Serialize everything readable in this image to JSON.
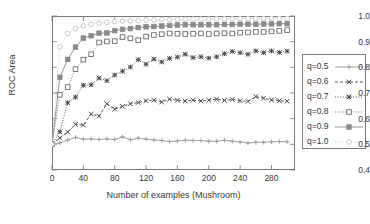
{
  "chart_data": {
    "type": "line",
    "title": "",
    "subtitle": "",
    "xlabel": "Number of examples (Mushroom)",
    "ylabel": "ROC Area",
    "xlim": [
      0,
      310
    ],
    "ylim": [
      0.4,
      1.0
    ],
    "xticks": [
      0,
      40,
      80,
      120,
      160,
      200,
      240,
      280
    ],
    "yticks": [
      "0.4",
      "0.5",
      "0.6",
      "0.7",
      "0.8",
      "0.9",
      "1.0"
    ],
    "grid": false,
    "legend_position": "right-outside",
    "x": [
      0,
      10,
      20,
      30,
      40,
      50,
      60,
      70,
      80,
      90,
      100,
      110,
      120,
      130,
      140,
      150,
      160,
      170,
      180,
      190,
      200,
      210,
      220,
      230,
      240,
      250,
      260,
      270,
      280,
      290,
      300
    ],
    "series": [
      {
        "name": "q=0.5",
        "label": "q=0.5",
        "marker": "plus",
        "linestyle": "solid",
        "color": "#9a9a9a",
        "values": [
          0.5,
          0.505,
          0.517,
          0.527,
          0.52,
          0.521,
          0.519,
          0.521,
          0.519,
          0.529,
          0.518,
          0.524,
          0.52,
          0.517,
          0.515,
          0.511,
          0.513,
          0.516,
          0.515,
          0.515,
          0.512,
          0.512,
          0.516,
          0.512,
          0.509,
          0.505,
          0.508,
          0.508,
          0.51,
          0.511,
          0.51
        ]
      },
      {
        "name": "q=0.6",
        "label": "q=0.6",
        "marker": "cross",
        "linestyle": "dashed",
        "color": "#4a4a4a",
        "values": [
          0.5,
          0.525,
          0.548,
          0.578,
          0.575,
          0.618,
          0.61,
          0.658,
          0.637,
          0.648,
          0.658,
          0.663,
          0.67,
          0.672,
          0.665,
          0.676,
          0.672,
          0.669,
          0.672,
          0.669,
          0.672,
          0.676,
          0.671,
          0.675,
          0.67,
          0.667,
          0.686,
          0.68,
          0.673,
          0.67,
          0.668
        ]
      },
      {
        "name": "q=0.7",
        "label": "q=0.7",
        "marker": "star",
        "linestyle": "dotted",
        "color": "#4a4a4a",
        "values": [
          0.5,
          0.549,
          0.662,
          0.684,
          0.73,
          0.732,
          0.758,
          0.748,
          0.77,
          0.785,
          0.801,
          0.83,
          0.812,
          0.832,
          0.821,
          0.835,
          0.84,
          0.851,
          0.838,
          0.841,
          0.836,
          0.841,
          0.853,
          0.862,
          0.857,
          0.851,
          0.864,
          0.857,
          0.864,
          0.858,
          0.863
        ]
      },
      {
        "name": "q=0.8",
        "label": "q=0.8",
        "marker": "square-open",
        "linestyle": "dotted",
        "color": "#6d6d6d",
        "values": [
          0.5,
          0.693,
          0.723,
          0.793,
          0.83,
          0.851,
          0.897,
          0.901,
          0.902,
          0.918,
          0.913,
          0.906,
          0.92,
          0.926,
          0.929,
          0.932,
          0.931,
          0.93,
          0.931,
          0.932,
          0.93,
          0.932,
          0.933,
          0.932,
          0.935,
          0.936,
          0.938,
          0.938,
          0.94,
          0.942,
          0.945
        ]
      },
      {
        "name": "q=0.9",
        "label": "q=0.9",
        "marker": "square-filled",
        "linestyle": "solid",
        "color": "#8a8a8a",
        "values": [
          0.5,
          0.761,
          0.831,
          0.879,
          0.914,
          0.923,
          0.933,
          0.934,
          0.943,
          0.948,
          0.951,
          0.955,
          0.958,
          0.959,
          0.961,
          0.963,
          0.965,
          0.966,
          0.966,
          0.966,
          0.966,
          0.966,
          0.967,
          0.967,
          0.968,
          0.968,
          0.968,
          0.969,
          0.969,
          0.97,
          0.97
        ]
      },
      {
        "name": "q=1.0",
        "label": "q=1.0",
        "marker": "circle-open",
        "linestyle": "dotted",
        "color": "#c4c4c4",
        "values": [
          0.5,
          0.88,
          0.932,
          0.951,
          0.962,
          0.968,
          0.972,
          0.975,
          0.978,
          0.98,
          0.981,
          0.983,
          0.984,
          0.985,
          0.986,
          0.986,
          0.987,
          0.987,
          0.988,
          0.988,
          0.988,
          0.989,
          0.989,
          0.989,
          0.99,
          0.99,
          0.99,
          0.99,
          0.991,
          0.991,
          0.991
        ]
      }
    ]
  }
}
